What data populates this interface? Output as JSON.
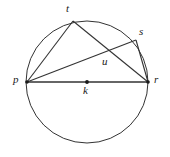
{
  "figure": {
    "type": "circle-geometry-diagram",
    "background_color": "#ffffff",
    "stroke_color": "#333333",
    "label_color": "#1a1a1a",
    "circle": {
      "name": "circle-k",
      "cx": 87,
      "cy": 82,
      "r": 61
    },
    "points": [
      {
        "id": "t",
        "label": "t",
        "x": 73,
        "y": 21,
        "label_x": 66,
        "label_y": 3,
        "dot": false
      },
      {
        "id": "s",
        "label": "s",
        "x": 136,
        "y": 40,
        "label_x": 139,
        "label_y": 26,
        "dot": false
      },
      {
        "id": "p",
        "label": "p",
        "x": 27,
        "y": 82,
        "label_x": 13,
        "label_y": 74,
        "dot": true
      },
      {
        "id": "r",
        "label": "r",
        "x": 148,
        "y": 82,
        "label_x": 154,
        "label_y": 74,
        "dot": true
      },
      {
        "id": "u",
        "label": "u",
        "x": 108,
        "y": 53,
        "label_x": 102,
        "label_y": 56,
        "dot": false
      },
      {
        "id": "k",
        "label": "k",
        "x": 87,
        "y": 82,
        "label_x": 83,
        "label_y": 85,
        "dot": true
      }
    ],
    "segments": [
      {
        "name": "segment-p-r",
        "from": "p",
        "to": "r"
      },
      {
        "name": "segment-p-t",
        "from": "p",
        "to": "t"
      },
      {
        "name": "segment-p-s",
        "from": "p",
        "to": "s"
      },
      {
        "name": "segment-t-r",
        "from": "t",
        "to": "r"
      },
      {
        "name": "segment-s-r",
        "from": "s",
        "to": "r"
      }
    ],
    "labels": {
      "t": "t",
      "s": "s",
      "p": "p",
      "r": "r",
      "u": "u",
      "k": "k"
    }
  }
}
